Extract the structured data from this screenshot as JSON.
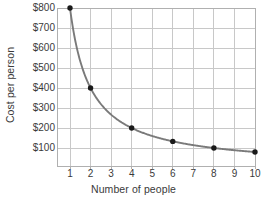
{
  "chart_data": {
    "type": "line",
    "title": "",
    "xlabel": "Number of people",
    "ylabel": "Cost per person",
    "x": [
      1,
      2,
      4,
      6,
      8,
      10
    ],
    "values": [
      800,
      400,
      200,
      133,
      100,
      80
    ],
    "series": [
      {
        "name": "Cost per person",
        "x": [
          1,
          2,
          4,
          6,
          8,
          10
        ],
        "values": [
          800,
          400,
          200,
          133,
          100,
          80
        ]
      }
    ],
    "xlim": [
      0.6,
      10
    ],
    "ylim": [
      10,
      800
    ],
    "xticks": [
      1,
      2,
      3,
      4,
      5,
      6,
      7,
      8,
      9,
      10
    ],
    "xtick_labels": [
      "1",
      "2",
      "3",
      "4",
      "5",
      "6",
      "7",
      "8",
      "9",
      "10"
    ],
    "yticks": [
      100,
      200,
      300,
      400,
      500,
      600,
      700,
      800
    ],
    "ytick_labels": [
      "$100",
      "$200",
      "$300",
      "$400",
      "$500",
      "$600",
      "$700",
      "$800"
    ],
    "grid": true,
    "legend": false,
    "legend_position": "none",
    "marker": "filled-circle",
    "line_color": "#7a7a7a",
    "marker_color": "#1a1a1a",
    "grid_color": "#c8c8c8",
    "frame_color": "#b0b0b0",
    "background_color": "#ffffff"
  }
}
